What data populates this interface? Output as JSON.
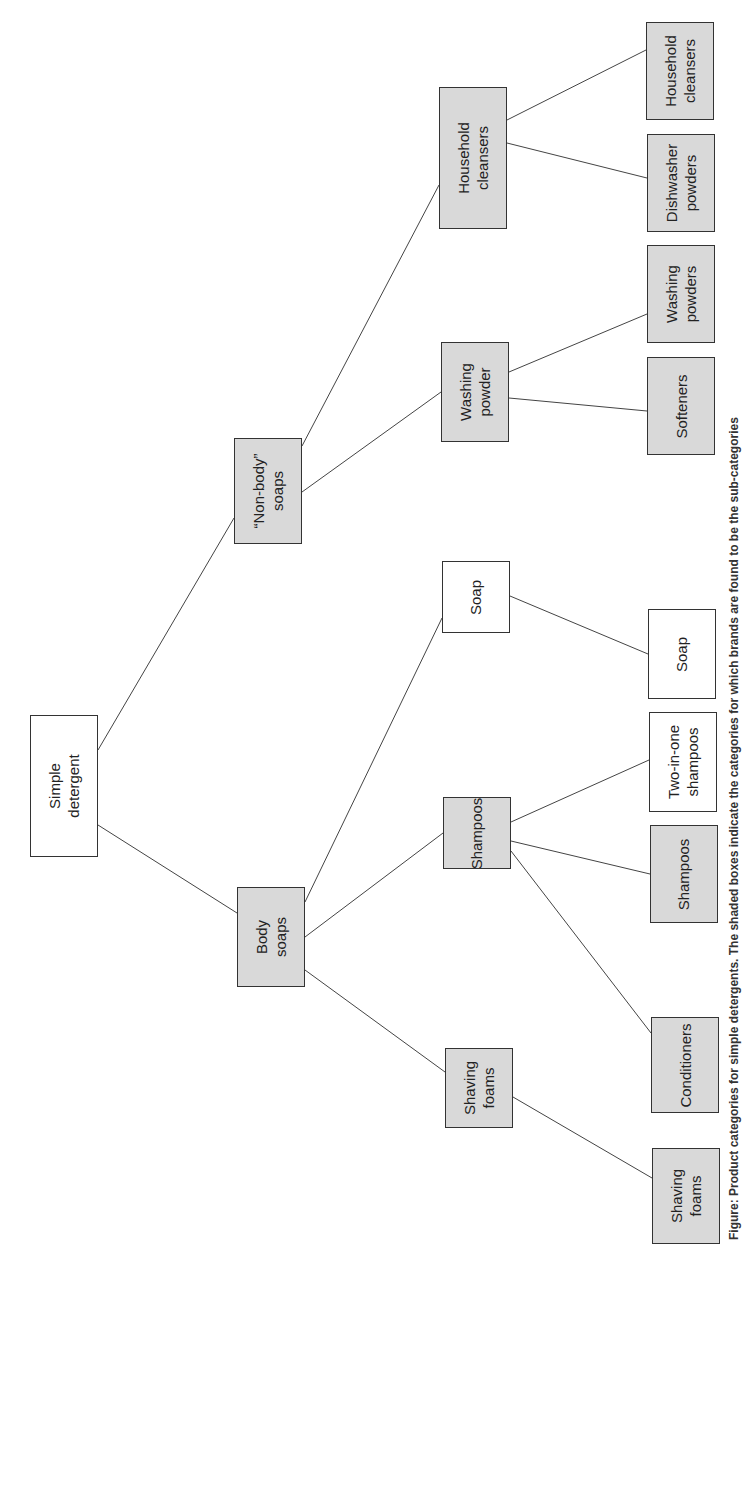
{
  "diagram": {
    "type": "tree",
    "orientation": "rotated-90-left-to-right",
    "colors": {
      "shaded": "#d9d9d9",
      "plain": "#ffffff",
      "border": "#333333",
      "line": "#444444"
    },
    "nodes": [
      {
        "id": "root",
        "label": "Simple\ndetergent",
        "shaded": false,
        "x": 30,
        "y": 715,
        "w": 68,
        "h": 142
      },
      {
        "id": "nonbody",
        "label": "“Non-body”\nsoaps",
        "shaded": true,
        "x": 234,
        "y": 438,
        "w": 68,
        "h": 106
      },
      {
        "id": "body",
        "label": "Body\nsoaps",
        "shaded": true,
        "x": 237,
        "y": 887,
        "w": 68,
        "h": 100
      },
      {
        "id": "hh",
        "label": "Household\ncleansers",
        "shaded": true,
        "x": 439,
        "y": 87,
        "w": 68,
        "h": 142
      },
      {
        "id": "wp",
        "label": "Washing\npowder",
        "shaded": true,
        "x": 441,
        "y": 342,
        "w": 68,
        "h": 100
      },
      {
        "id": "soap",
        "label": "Soap",
        "shaded": false,
        "x": 442,
        "y": 561,
        "w": 68,
        "h": 72
      },
      {
        "id": "sham",
        "label": "Shampoos",
        "shaded": true,
        "x": 443,
        "y": 797,
        "w": 68,
        "h": 72
      },
      {
        "id": "shav",
        "label": "Shaving\nfoams",
        "shaded": true,
        "x": 445,
        "y": 1048,
        "w": 68,
        "h": 80
      },
      {
        "id": "l_hh",
        "label": "Household\ncleansers",
        "shaded": true,
        "x": 646,
        "y": 22,
        "w": 68,
        "h": 98
      },
      {
        "id": "l_dw",
        "label": "Dishwasher\npowders",
        "shaded": true,
        "x": 647,
        "y": 134,
        "w": 68,
        "h": 98
      },
      {
        "id": "l_wps",
        "label": "Washing\npowders",
        "shaded": true,
        "x": 647,
        "y": 245,
        "w": 68,
        "h": 98
      },
      {
        "id": "l_soft",
        "label": "Softeners",
        "shaded": true,
        "x": 647,
        "y": 357,
        "w": 68,
        "h": 98
      },
      {
        "id": "l_soap",
        "label": "Soap",
        "shaded": false,
        "x": 648,
        "y": 609,
        "w": 68,
        "h": 90
      },
      {
        "id": "l_two",
        "label": "Two-in-one\nshampoos",
        "shaded": false,
        "x": 649,
        "y": 712,
        "w": 68,
        "h": 100
      },
      {
        "id": "l_sham",
        "label": "Shampoos",
        "shaded": true,
        "x": 650,
        "y": 825,
        "w": 68,
        "h": 98
      },
      {
        "id": "l_cond",
        "label": "Conditioners",
        "shaded": true,
        "x": 651,
        "y": 1017,
        "w": 68,
        "h": 96
      },
      {
        "id": "l_shav",
        "label": "Shaving\nfoams",
        "shaded": true,
        "x": 652,
        "y": 1148,
        "w": 68,
        "h": 96
      }
    ],
    "edges": [
      {
        "x1": 98,
        "y1": 750,
        "x2": 234,
        "y2": 518
      },
      {
        "x1": 98,
        "y1": 825,
        "x2": 237,
        "y2": 913
      },
      {
        "x1": 302,
        "y1": 446,
        "x2": 439,
        "y2": 185
      },
      {
        "x1": 302,
        "y1": 492,
        "x2": 441,
        "y2": 392
      },
      {
        "x1": 305,
        "y1": 902,
        "x2": 442,
        "y2": 618
      },
      {
        "x1": 305,
        "y1": 937,
        "x2": 443,
        "y2": 833
      },
      {
        "x1": 305,
        "y1": 970,
        "x2": 445,
        "y2": 1072
      },
      {
        "x1": 507,
        "y1": 120,
        "x2": 646,
        "y2": 50
      },
      {
        "x1": 507,
        "y1": 143,
        "x2": 647,
        "y2": 178
      },
      {
        "x1": 509,
        "y1": 372,
        "x2": 647,
        "y2": 314
      },
      {
        "x1": 509,
        "y1": 398,
        "x2": 647,
        "y2": 411
      },
      {
        "x1": 510,
        "y1": 596,
        "x2": 648,
        "y2": 654
      },
      {
        "x1": 511,
        "y1": 822,
        "x2": 649,
        "y2": 760
      },
      {
        "x1": 511,
        "y1": 841,
        "x2": 650,
        "y2": 874
      },
      {
        "x1": 511,
        "y1": 851,
        "x2": 651,
        "y2": 1033
      },
      {
        "x1": 513,
        "y1": 1097,
        "x2": 652,
        "y2": 1178
      }
    ]
  },
  "caption": {
    "text": "Figure: Product categories for simple detergents. The shaded boxes indicate the categories for which brands are found to be the sub-categories"
  }
}
